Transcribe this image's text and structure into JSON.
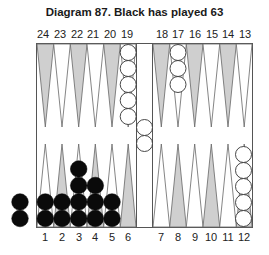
{
  "title": "Diagram 87.  Black has played 63",
  "top_labels": [
    "24",
    "23",
    "22",
    "21",
    "20",
    "19",
    "18",
    "17",
    "16",
    "15",
    "14",
    "13"
  ],
  "bottom_labels": [
    "1",
    "2",
    "3",
    "4",
    "5",
    "6",
    "7",
    "8",
    "9",
    "10",
    "11",
    "12"
  ],
  "colors": {
    "shaded_point": "#cfcfcf",
    "line": "#555555",
    "black_checker": "#0a0a0a",
    "white_checker": "#ffffff"
  },
  "position": {
    "black": {
      "1": 2,
      "2": 2,
      "3": 4,
      "4": 3,
      "5": 2,
      "off": 2
    },
    "white": {
      "19": 5,
      "17": 3,
      "12": 5,
      "bar": 2
    }
  }
}
